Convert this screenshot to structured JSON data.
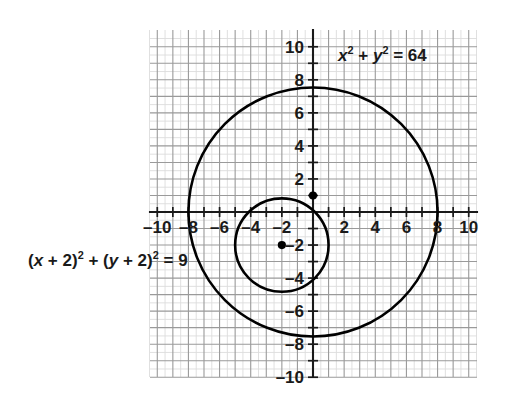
{
  "chart_data": {
    "type": "scatter",
    "title": "",
    "xlabel": "",
    "ylabel": "",
    "xlim": [
      -10.5,
      10.5
    ],
    "ylim": [
      -10.5,
      10.5
    ],
    "grid": true,
    "grid_major_step": 1,
    "grid_minor_step": 0.5,
    "legend_position": "none",
    "x_tick_labels": [
      "-10",
      "-8",
      "-6",
      "-4",
      "-2",
      "2",
      "4",
      "6",
      "8",
      "10"
    ],
    "x_tick_values": [
      -10,
      -8,
      -6,
      -4,
      -2,
      2,
      4,
      6,
      8,
      10
    ],
    "y_tick_labels": [
      "10",
      "8",
      "6",
      "4",
      "2",
      "-2",
      "-4",
      "-6",
      "-8",
      "-10"
    ],
    "y_tick_values": [
      10,
      8,
      6,
      4,
      2,
      -2,
      -4,
      -6,
      -8,
      -10
    ],
    "series": [
      {
        "name": "x^2 + y^2 = 64",
        "shape": "circle",
        "center": [
          0,
          0
        ],
        "radius": 8
      },
      {
        "name": "(x + 2)^2 + (y + 2)^2 = 9",
        "shape": "circle",
        "center": [
          -2,
          -2
        ],
        "radius": 3
      }
    ],
    "points": [
      {
        "name": "inner-circle-center",
        "x": -2,
        "y": -2
      },
      {
        "name": "intersection-point",
        "x": 0,
        "y": 1
      }
    ],
    "annotations": [
      {
        "name": "outer-circle-equation",
        "text": "x² + y² = 64",
        "x": 4.5,
        "y": 9
      },
      {
        "name": "inner-circle-equation",
        "text": "(x + 2)² + (y + 2)² = 9",
        "x": -14,
        "y": -3
      }
    ]
  },
  "graph": {
    "x_ticks": [
      {
        "value": -10,
        "label": "–10"
      },
      {
        "value": -8,
        "label": "–8"
      },
      {
        "value": -6,
        "label": "–6"
      },
      {
        "value": -4,
        "label": "–4"
      },
      {
        "value": -2,
        "label": "–2"
      },
      {
        "value": 2,
        "label": "2"
      },
      {
        "value": 4,
        "label": "4"
      },
      {
        "value": 6,
        "label": "6"
      },
      {
        "value": 8,
        "label": "8"
      },
      {
        "value": 10,
        "label": "10"
      }
    ],
    "y_ticks": [
      {
        "value": 10,
        "label": "10"
      },
      {
        "value": 8,
        "label": "8"
      },
      {
        "value": 6,
        "label": "6"
      },
      {
        "value": 4,
        "label": "4"
      },
      {
        "value": 2,
        "label": "2"
      },
      {
        "value": -2,
        "label": "–2"
      },
      {
        "value": -4,
        "label": "–4"
      },
      {
        "value": -6,
        "label": "–6"
      },
      {
        "value": -8,
        "label": "–8"
      },
      {
        "value": -10,
        "label": "–10"
      }
    ],
    "equations": {
      "outer": {
        "lhs_var1": "x",
        "exp1": "2",
        "plus": " + ",
        "lhs_var2": "y",
        "exp2": "2",
        "equals": " = ",
        "rhs": "64"
      },
      "inner": {
        "open1": "(",
        "var1": "x",
        "add1": " + 2)",
        "exp1": "2",
        "plus": " + ",
        "open2": "(",
        "var2": "y",
        "add2": " + 2)",
        "exp2": "2",
        "equals": " = ",
        "rhs": "9"
      }
    },
    "colors": {
      "curve": "#000000",
      "axis": "#1a1a1a",
      "major_grid": "#9a9a9a",
      "minor_grid": "#dcdcdc",
      "background": "#ffffff"
    }
  }
}
